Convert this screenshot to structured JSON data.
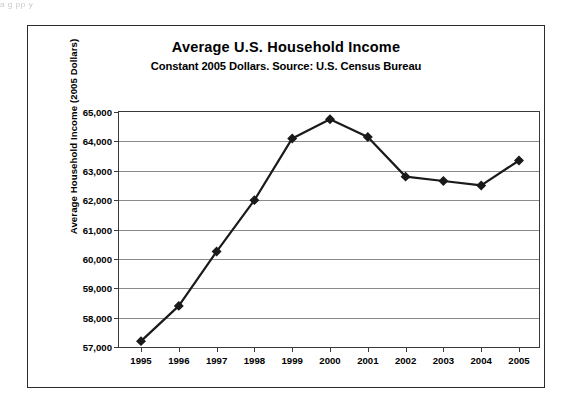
{
  "page": {
    "scan_remnant_text": "a  g        pp                                                                                                                  y"
  },
  "figure": {
    "title": "Average U.S. Household Income",
    "subtitle": "Constant 2005 Dollars.  Source: U.S. Census Bureau",
    "y_axis_title": "Average Household Income (2005 Dollars)"
  },
  "chart_data": {
    "type": "line",
    "title": "Average U.S. Household Income",
    "subtitle": "Constant 2005 Dollars.  Source: U.S. Census Bureau",
    "xlabel": "",
    "ylabel": "Average Household Income (2005 Dollars)",
    "categories": [
      "1995",
      "1996",
      "1997",
      "1998",
      "1999",
      "2000",
      "2001",
      "2002",
      "2003",
      "2004",
      "2005"
    ],
    "x": [
      1995,
      1996,
      1997,
      1998,
      1999,
      2000,
      2001,
      2002,
      2003,
      2004,
      2005
    ],
    "values": [
      57200,
      58400,
      60250,
      62000,
      64100,
      64750,
      64150,
      62800,
      62650,
      62500,
      63350
    ],
    "ylim": [
      57000,
      65000
    ],
    "ytick_labels": [
      "65,000",
      "64,000",
      "63,000",
      "62,000",
      "61,000",
      "60,000",
      "59,000",
      "58,000",
      "57,000"
    ],
    "ytick_values": [
      65000,
      64000,
      63000,
      62000,
      61000,
      60000,
      59000,
      58000,
      57000
    ],
    "grid": true,
    "legend": "none",
    "marker": "diamond",
    "line_color": "#1a1a1a",
    "marker_color": "#1a1a1a",
    "grid_color": "#8a8a8a",
    "axis_color": "#3a3a3a"
  }
}
